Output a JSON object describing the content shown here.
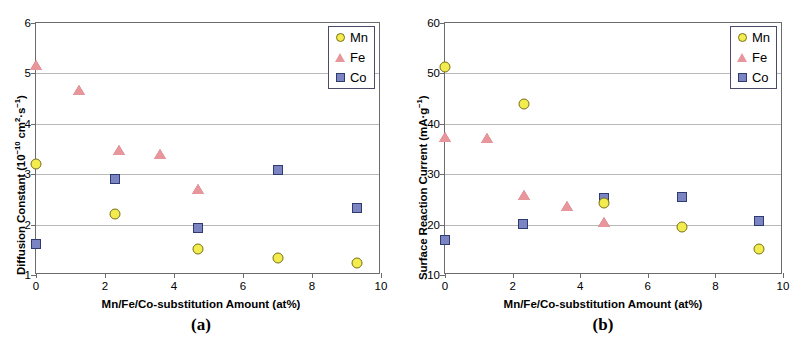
{
  "figure": {
    "panels": [
      {
        "caption": "(a)",
        "xlabel": "Mn/Fe/Co-substitution Amount (at%)",
        "ylabel_html": "Diffusion Constant (10<sup>−10</sup> cm<sup>2</sup>·s<sup>−1</sup>)",
        "ylabel_text": "Diffusion Constant (10-10 cm2·s-1)",
        "xticks": [
          "0",
          "2",
          "4",
          "6",
          "8",
          "10"
        ],
        "yticks": [
          "1",
          "2",
          "3",
          "4",
          "5",
          "6"
        ],
        "legend": [
          "Mn",
          "Fe",
          "Co"
        ]
      },
      {
        "caption": "(b)",
        "xlabel": "Mn/Fe/Co-substitution Amount (at%)",
        "ylabel_html": "Surface Reaction Current (mA·g<sup>−1</sup>)",
        "ylabel_text": "Surface Reaction Current (mA·g-1)",
        "xticks": [
          "0",
          "2",
          "4",
          "6",
          "8",
          "10"
        ],
        "yticks": [
          "10",
          "20",
          "30",
          "40",
          "50",
          "60"
        ],
        "legend": [
          "Mn",
          "Fe",
          "Co"
        ]
      }
    ]
  },
  "colors": {
    "mn": "#f2ec4e",
    "mn_edge": "#7a6f18",
    "fe": "#e8969c",
    "fe_edge": "#b05c63",
    "co": "#7b85c4",
    "co_edge": "#2f3a6e",
    "frame": "#6b6b6b",
    "grid": "#b9b9b9",
    "legend_border": "#4a4a6a"
  },
  "chart_data": [
    {
      "type": "scatter",
      "panel": "(a)",
      "title": "Diffusion Constant vs Mn/Fe/Co-substitution Amount",
      "xlabel": "Mn/Fe/Co-substitution Amount (at%)",
      "ylabel": "Diffusion Constant (10^-10 cm^2·s^-1)",
      "xlim": [
        0,
        10
      ],
      "ylim": [
        1,
        6
      ],
      "xticks": [
        0,
        2,
        4,
        6,
        8,
        10
      ],
      "yticks": [
        1,
        2,
        3,
        4,
        5,
        6
      ],
      "grid": "horizontal",
      "legend_position": "top-right",
      "series": [
        {
          "name": "Mn",
          "marker": "circle",
          "color": "#f2ec4e",
          "points": [
            {
              "x": 0.0,
              "y": 3.2
            },
            {
              "x": 2.3,
              "y": 2.22
            },
            {
              "x": 4.7,
              "y": 1.52
            },
            {
              "x": 7.0,
              "y": 1.33
            },
            {
              "x": 9.3,
              "y": 1.24
            }
          ]
        },
        {
          "name": "Fe",
          "marker": "triangle",
          "color": "#e8969c",
          "points": [
            {
              "x": 0.0,
              "y": 5.17
            },
            {
              "x": 1.25,
              "y": 4.68
            },
            {
              "x": 2.4,
              "y": 3.49
            },
            {
              "x": 3.6,
              "y": 3.4
            },
            {
              "x": 4.7,
              "y": 2.71
            }
          ]
        },
        {
          "name": "Co",
          "marker": "square",
          "color": "#7b85c4",
          "points": [
            {
              "x": 0.0,
              "y": 1.62
            },
            {
              "x": 2.3,
              "y": 2.9
            },
            {
              "x": 4.7,
              "y": 1.93
            },
            {
              "x": 7.0,
              "y": 3.09
            },
            {
              "x": 9.3,
              "y": 2.33
            }
          ]
        }
      ]
    },
    {
      "type": "scatter",
      "panel": "(b)",
      "title": "Surface Reaction Current vs Mn/Fe/Co-substitution Amount",
      "xlabel": "Mn/Fe/Co-substitution Amount (at%)",
      "ylabel": "Surface Reaction Current (mA·g^-1)",
      "xlim": [
        0,
        10
      ],
      "ylim": [
        10,
        60
      ],
      "xticks": [
        0,
        2,
        4,
        6,
        8,
        10
      ],
      "yticks": [
        10,
        20,
        30,
        40,
        50,
        60
      ],
      "grid": "horizontal",
      "legend_position": "top-right",
      "series": [
        {
          "name": "Mn",
          "marker": "circle",
          "color": "#f2ec4e",
          "points": [
            {
              "x": 0.0,
              "y": 51.3
            },
            {
              "x": 2.35,
              "y": 44.0
            },
            {
              "x": 4.7,
              "y": 24.2
            },
            {
              "x": 7.0,
              "y": 19.6
            },
            {
              "x": 9.3,
              "y": 15.1
            }
          ]
        },
        {
          "name": "Fe",
          "marker": "triangle",
          "color": "#e8969c",
          "points": [
            {
              "x": 0.0,
              "y": 37.4
            },
            {
              "x": 1.25,
              "y": 37.1
            },
            {
              "x": 2.35,
              "y": 25.8
            },
            {
              "x": 3.6,
              "y": 23.6
            },
            {
              "x": 4.7,
              "y": 20.5
            }
          ]
        },
        {
          "name": "Co",
          "marker": "square",
          "color": "#7b85c4",
          "points": [
            {
              "x": 0.0,
              "y": 17.0
            },
            {
              "x": 2.3,
              "y": 20.2
            },
            {
              "x": 4.7,
              "y": 25.3
            },
            {
              "x": 7.0,
              "y": 25.4
            },
            {
              "x": 9.3,
              "y": 20.7
            }
          ]
        }
      ]
    }
  ]
}
